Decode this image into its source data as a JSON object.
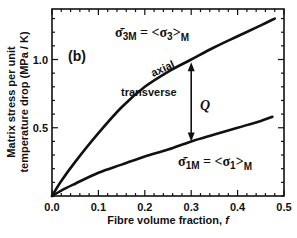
{
  "chart_data": {
    "type": "line",
    "panel_label": "(b)",
    "xlabel": "Fibre volume fraction, f",
    "xlabel_text": "Fibre volume fraction, ",
    "xlabel_var": "f",
    "ylabel_line1": "Matrix stress per unit",
    "ylabel_line2": "temperature drop (MPa / K)",
    "xlim": [
      0,
      0.5
    ],
    "ylim": [
      0,
      1.37
    ],
    "xticks": [
      0.0,
      0.1,
      0.2,
      0.3,
      0.4,
      0.5
    ],
    "xtick_labels": [
      "0.0",
      "0.1",
      "0.2",
      "0.3",
      "0.4",
      "0.5"
    ],
    "yticks": [
      0.5,
      1.0
    ],
    "ytick_labels": [
      "0.5",
      "1.0"
    ],
    "x_minor_step": 0.02,
    "y_minor_step": 0.1,
    "grid": false,
    "series": [
      {
        "name": "axial",
        "label": "axial",
        "x": [
          0,
          0.02,
          0.05,
          0.1,
          0.15,
          0.2,
          0.25,
          0.3,
          0.35,
          0.4,
          0.45,
          0.48
        ],
        "y": [
          0,
          0.11,
          0.25,
          0.46,
          0.65,
          0.8,
          0.91,
          1.0,
          1.09,
          1.17,
          1.25,
          1.3
        ]
      },
      {
        "name": "transverse",
        "label": "transverse",
        "x": [
          0,
          0.02,
          0.05,
          0.1,
          0.15,
          0.2,
          0.25,
          0.3,
          0.35,
          0.4,
          0.45,
          0.475
        ],
        "y": [
          0,
          0.04,
          0.09,
          0.17,
          0.23,
          0.29,
          0.34,
          0.4,
          0.45,
          0.5,
          0.55,
          0.58
        ]
      }
    ],
    "annotations": {
      "axial_equation": {
        "lhs": "σ̄",
        "lhs_sub": "3M",
        "eq": " = <σ",
        "rhs_sub": "3",
        "close": ">",
        "close_sub": "M"
      },
      "transverse_equation": {
        "lhs": "σ̄",
        "lhs_sub": "1M",
        "eq": " = <σ",
        "rhs_sub": "1",
        "close": ">",
        "close_sub": "M"
      },
      "gap_arrow": {
        "x": 0.3,
        "y_top": 0.98,
        "y_bottom": 0.4,
        "label": "Q"
      }
    }
  }
}
